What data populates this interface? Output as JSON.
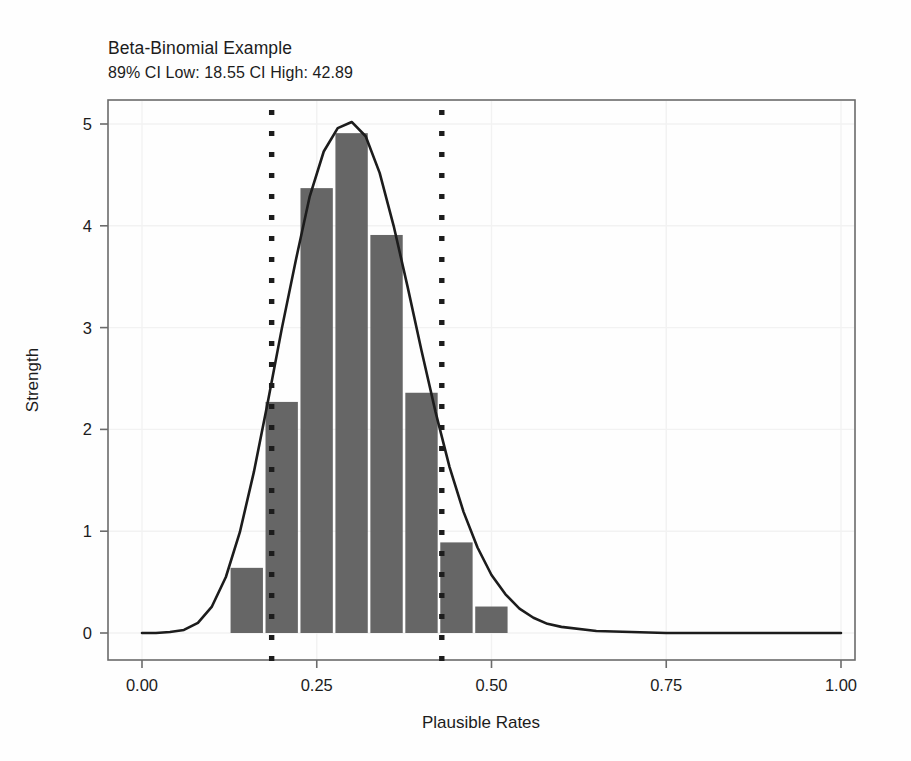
{
  "chart_data": {
    "type": "bar",
    "title": "Beta-Binomial Example",
    "subtitle": "89% CI Low: 18.55 CI High: 42.89",
    "xlabel": "Plausible Rates",
    "ylabel": "Strength",
    "xlim": [
      0.0,
      1.0
    ],
    "ylim": [
      0.0,
      5.35
    ],
    "xticks": [
      "0.00",
      "0.25",
      "0.50",
      "0.75",
      "1.00"
    ],
    "xtick_values": [
      0.0,
      0.25,
      0.5,
      0.75,
      1.0
    ],
    "yticks": [
      "0",
      "1",
      "2",
      "3",
      "4",
      "5"
    ],
    "ytick_values": [
      0,
      1,
      2,
      3,
      4,
      5
    ],
    "grid": true,
    "legend": "none",
    "bar_color": "#666666",
    "line_color": "#1c1c1c",
    "ci_line_color": "#1c1c1c",
    "bin_width": 0.05,
    "bin_starts": [
      0.125,
      0.175,
      0.225,
      0.275,
      0.325,
      0.375,
      0.425,
      0.475,
      0.525
    ],
    "values": [
      0.64,
      2.27,
      4.37,
      4.91,
      3.91,
      2.36,
      0.89,
      0.26,
      0.0
    ],
    "categories": [
      "0.125",
      "0.175",
      "0.225",
      "0.275",
      "0.325",
      "0.375",
      "0.425",
      "0.475",
      "0.525"
    ],
    "series": [
      {
        "name": "Posterior histogram",
        "type": "bar",
        "values": [
          0.64,
          2.27,
          4.37,
          4.91,
          3.91,
          2.36,
          0.89,
          0.26,
          0.0
        ]
      },
      {
        "name": "Posterior density",
        "type": "line",
        "x": [
          0.0,
          0.02,
          0.04,
          0.06,
          0.08,
          0.1,
          0.12,
          0.14,
          0.16,
          0.18,
          0.2,
          0.22,
          0.24,
          0.26,
          0.28,
          0.3,
          0.32,
          0.34,
          0.36,
          0.38,
          0.4,
          0.42,
          0.44,
          0.46,
          0.48,
          0.5,
          0.52,
          0.54,
          0.56,
          0.58,
          0.6,
          0.65,
          0.7,
          0.75,
          0.8,
          0.85,
          0.9,
          0.95,
          1.0
        ],
        "y": [
          0.0,
          0.0,
          0.01,
          0.03,
          0.1,
          0.26,
          0.55,
          0.99,
          1.58,
          2.27,
          2.99,
          3.66,
          4.29,
          4.73,
          4.96,
          5.02,
          4.88,
          4.52,
          4.0,
          3.4,
          2.77,
          2.17,
          1.63,
          1.19,
          0.84,
          0.57,
          0.38,
          0.24,
          0.15,
          0.09,
          0.06,
          0.02,
          0.01,
          0.0,
          0.0,
          0.0,
          0.0,
          0.0,
          0.0
        ]
      }
    ],
    "annotations": [
      {
        "name": "ci-low-line",
        "type": "vline",
        "x": 0.1855,
        "label": "18.55",
        "style": "dotted"
      },
      {
        "name": "ci-high-line",
        "type": "vline",
        "x": 0.4289,
        "label": "42.89",
        "style": "dotted"
      }
    ]
  }
}
